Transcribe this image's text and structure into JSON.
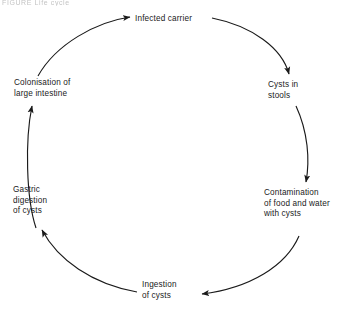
{
  "figure": {
    "caption_fragment": "FIGURE  Life cycle",
    "background_color": "#ffffff",
    "stroke_color": "#1a1a1a",
    "direction": "clockwise"
  },
  "nodes": [
    {
      "id": "infected-carrier",
      "lines": [
        "Infected carrier"
      ],
      "align": "left"
    },
    {
      "id": "cysts-in-stools",
      "lines": [
        "Cysts in",
        "stools"
      ],
      "align": "left"
    },
    {
      "id": "contamination",
      "lines": [
        "Contamination",
        "of food and water",
        "with cysts"
      ],
      "align": "left"
    },
    {
      "id": "ingestion",
      "lines": [
        "Ingestion",
        "of cysts"
      ],
      "align": "left"
    },
    {
      "id": "gastric-digestion",
      "lines": [
        "Gastric",
        "digestion",
        "of cysts"
      ],
      "align": "left"
    },
    {
      "id": "colonisation",
      "lines": [
        "Colonisation of",
        "large intestine"
      ],
      "align": "left"
    }
  ],
  "arrows": [
    {
      "id": "arrow-colonisation-to-infected-carrier",
      "from": "colonisation",
      "to": "infected-carrier"
    },
    {
      "id": "arrow-infected-carrier-to-cysts",
      "from": "infected-carrier",
      "to": "cysts-in-stools"
    },
    {
      "id": "arrow-cysts-to-contamination",
      "from": "cysts-in-stools",
      "to": "contamination"
    },
    {
      "id": "arrow-contamination-to-ingestion",
      "from": "contamination",
      "to": "ingestion"
    },
    {
      "id": "arrow-ingestion-to-gastric",
      "from": "ingestion",
      "to": "gastric-digestion"
    },
    {
      "id": "arrow-gastric-to-colonisation",
      "from": "gastric-digestion",
      "to": "colonisation"
    }
  ]
}
